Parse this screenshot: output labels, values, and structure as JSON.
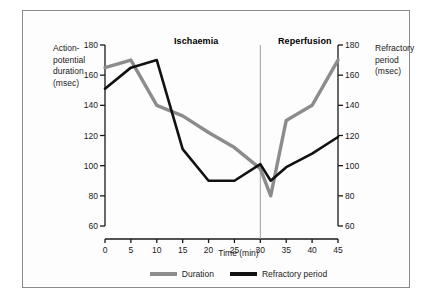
{
  "figure": {
    "left_axis_label": "Action-\npotential\nduration\n(msec)",
    "right_axis_label": "Refractory\nperiod\n(msec)",
    "phase_left": "Ischaemia",
    "phase_right": "Reperfusion"
  },
  "legend": {
    "items": [
      {
        "label": "Duration",
        "color": "#8c8c8c"
      },
      {
        "label": "Refractory period",
        "color": "#111111"
      }
    ]
  },
  "chart_data": {
    "type": "line",
    "title": "",
    "xlabel": "Time (min)",
    "ylabel": "Action-potential duration (msec)",
    "ylabel_right": "Refractory period (msec)",
    "xlim": [
      0,
      45
    ],
    "ylim": [
      60,
      180
    ],
    "xticks": [
      0,
      5,
      10,
      15,
      20,
      25,
      30,
      35,
      40,
      45
    ],
    "yticks": [
      60,
      80,
      100,
      120,
      140,
      160,
      180
    ],
    "yticks_right": [
      60,
      80,
      100,
      120,
      140,
      160,
      180
    ],
    "grid": false,
    "legend_position": "bottom",
    "annotations": [
      {
        "text": "Ischaemia",
        "x_range": [
          0,
          30
        ]
      },
      {
        "text": "Reperfusion",
        "x_range": [
          30,
          45
        ]
      },
      {
        "text": "divider",
        "x": 30
      }
    ],
    "series": [
      {
        "name": "Duration",
        "color": "#8c8c8c",
        "x": [
          0,
          5,
          10,
          15,
          20,
          25,
          30,
          32,
          35,
          40,
          45
        ],
        "values": [
          165,
          170,
          140,
          133,
          122,
          112,
          98,
          80,
          130,
          140,
          170
        ]
      },
      {
        "name": "Refractory period",
        "color": "#111111",
        "x": [
          0,
          5,
          10,
          15,
          20,
          25,
          30,
          32,
          35,
          40,
          45
        ],
        "values": [
          151,
          165,
          170,
          111,
          90,
          90,
          101,
          90,
          99,
          108,
          119
        ]
      }
    ]
  }
}
